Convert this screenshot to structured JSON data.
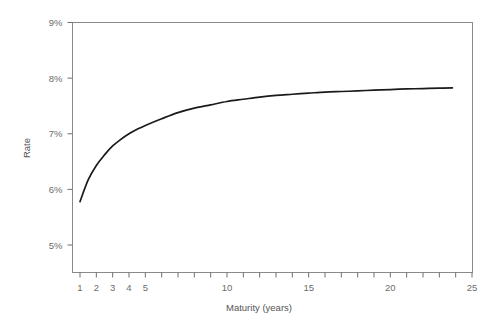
{
  "chart_data": {
    "type": "line",
    "title": "",
    "subtitle": "",
    "xlabel": "Maturity (years)",
    "ylabel": "Rate",
    "xlim": [
      0.4,
      25
    ],
    "ylim": [
      4.55,
      9
    ],
    "grid": false,
    "legend": "none",
    "x_tick_values": [
      1,
      2,
      3,
      4,
      5,
      6,
      7,
      8,
      9,
      10,
      11,
      12,
      13,
      14,
      15,
      16,
      17,
      18,
      19,
      20,
      21,
      22,
      23,
      24,
      25
    ],
    "x_tick_labels": [
      {
        "value": 1,
        "label": "1"
      },
      {
        "value": 2,
        "label": "2"
      },
      {
        "value": 3,
        "label": "3"
      },
      {
        "value": 4,
        "label": "4"
      },
      {
        "value": 5,
        "label": "5"
      },
      {
        "value": 10,
        "label": "10"
      },
      {
        "value": 15,
        "label": "15"
      },
      {
        "value": 20,
        "label": "20"
      },
      {
        "value": 25,
        "label": "25"
      }
    ],
    "y_tick_values": [
      5,
      6,
      7,
      8,
      9
    ],
    "y_tick_labels": [
      "5%",
      "6%",
      "7%",
      "8%",
      "9%"
    ],
    "series": [
      {
        "name": "Yield curve",
        "color": "#1a1a1a",
        "x": [
          1,
          1.5,
          2,
          2.5,
          3,
          3.5,
          4,
          4.5,
          5,
          6,
          7,
          8,
          9,
          10,
          11,
          12,
          13,
          14,
          15,
          16,
          17,
          18,
          19,
          20,
          21,
          22,
          23,
          23.8
        ],
        "values": [
          5.78,
          6.17,
          6.43,
          6.62,
          6.78,
          6.9,
          7.0,
          7.08,
          7.15,
          7.27,
          7.38,
          7.46,
          7.52,
          7.58,
          7.62,
          7.66,
          7.69,
          7.71,
          7.73,
          7.75,
          7.76,
          7.77,
          7.785,
          7.795,
          7.805,
          7.812,
          7.82,
          7.825
        ]
      }
    ]
  },
  "axes": {
    "y_title": "Rate",
    "x_title": "Maturity (years)"
  }
}
